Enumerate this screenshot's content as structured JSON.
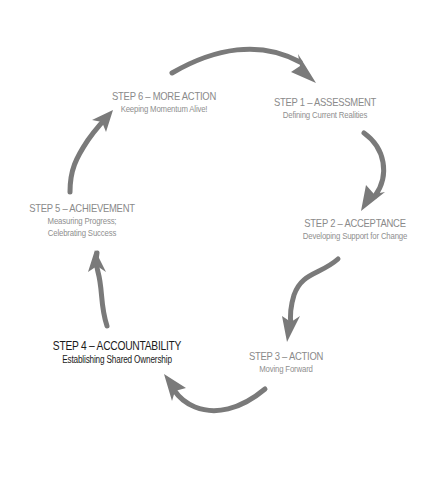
{
  "diagram": {
    "type": "cycle",
    "direction": "clockwise",
    "arrow_color": "#7a7a7a",
    "text_color": "#8a8a8a",
    "highlight_color": "#1a1a1a",
    "highlighted_step": 4,
    "steps": [
      {
        "number": 1,
        "title": "STEP 1 – ASSESSMENT",
        "subtitle_lines": [
          "Defining Current Realities"
        ]
      },
      {
        "number": 2,
        "title": "STEP 2 – ACCEPTANCE",
        "subtitle_lines": [
          "Developing Support for Change"
        ]
      },
      {
        "number": 3,
        "title": "STEP 3 – ACTION",
        "subtitle_lines": [
          "Moving Forward"
        ]
      },
      {
        "number": 4,
        "title": "STEP 4 – ACCOUNTABILITY",
        "subtitle_lines": [
          "Establishing Shared Ownership"
        ]
      },
      {
        "number": 5,
        "title": "STEP 5 – ACHIEVEMENT",
        "subtitle_lines": [
          "Measuring Progress;",
          "Celebrating Success"
        ]
      },
      {
        "number": 6,
        "title": "STEP 6 – MORE ACTION",
        "subtitle_lines": [
          "Keeping Momentum Alive!"
        ]
      }
    ],
    "arrows": [
      {
        "from": 6,
        "to": 1
      },
      {
        "from": 1,
        "to": 2
      },
      {
        "from": 2,
        "to": 3
      },
      {
        "from": 3,
        "to": 4
      },
      {
        "from": 4,
        "to": 5
      },
      {
        "from": 5,
        "to": 6
      }
    ]
  }
}
